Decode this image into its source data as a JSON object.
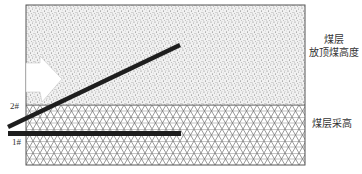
{
  "diagram": {
    "upper_zone": {
      "label_line1": "煤层",
      "label_line2": "放顶煤高度",
      "pattern": "stipple"
    },
    "lower_zone": {
      "label": "煤层采高",
      "pattern": "triangle-mesh"
    },
    "seams": [
      {
        "id": "2#",
        "label": "2#",
        "orientation": "inclined"
      },
      {
        "id": "1#",
        "label": "1#",
        "orientation": "horizontal"
      }
    ],
    "arrow": {
      "direction": "right",
      "color": "#ffffff"
    },
    "colors": {
      "border": "#555555",
      "stipple": "#8a8a8a",
      "mesh": "#6f6f6f",
      "seam": "#1e1e1e",
      "text": "#333333"
    }
  }
}
